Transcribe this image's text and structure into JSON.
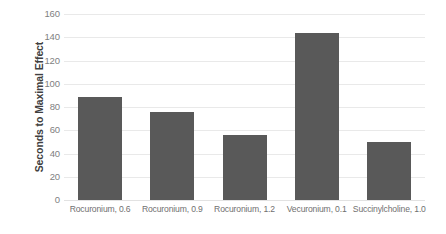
{
  "chart_data": {
    "type": "bar",
    "title": "",
    "subtitle": "",
    "xlabel": "",
    "ylabel": "Seconds to Maximal Effect",
    "categories": [
      "Rocuronium, 0.6",
      "Rocuronium, 0.9",
      "Rocuronium, 1.2",
      "Vecuronium, 0.1",
      "Succinylcholine, 1.0"
    ],
    "values": [
      89,
      76,
      56,
      144,
      50
    ],
    "ylim": [
      0,
      160
    ],
    "ytick_labels": [
      "160",
      "140",
      "120",
      "100",
      "80",
      "60",
      "40",
      "20",
      "0"
    ],
    "ytick_values": [
      160,
      140,
      120,
      100,
      80,
      60,
      40,
      20,
      0
    ],
    "grid": true,
    "grid_axis": "y",
    "legend": false,
    "legend_position": "none",
    "bar_color": "#595959",
    "grid_color": "#e9e9e9",
    "tick_text_color": "#7f7f7f",
    "axis_title_color": "#404040",
    "category_text_color": "#707070",
    "background_color": "#ffffff"
  }
}
